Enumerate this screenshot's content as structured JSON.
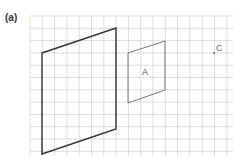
{
  "figure": {
    "part_label": "(a)",
    "shape_a_label": "A",
    "point_c_label": "C",
    "grid": {
      "x0": 30,
      "y0": 16,
      "cols": 17,
      "rows": 12,
      "step": 12.3
    },
    "colors": {
      "grid": "#cccccc",
      "large_shape": "#333333",
      "shape_a": "#666666"
    }
  }
}
